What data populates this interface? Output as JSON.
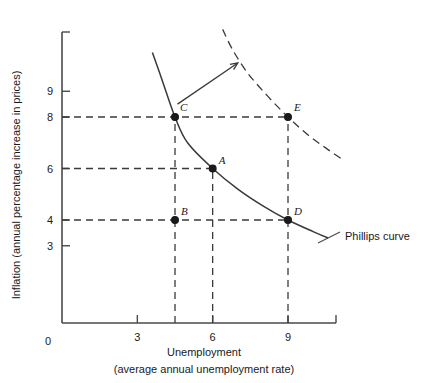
{
  "chart_data": {
    "type": "scatter",
    "title": "",
    "xlabel": "Unemployment",
    "xlabel_sub": "(average annual unemployment rate)",
    "ylabel": "Inflation (annual percentage increase in prices)",
    "xlim": [
      0,
      10.8
    ],
    "ylim": [
      0,
      11.5
    ],
    "xticks": [
      3,
      6,
      9
    ],
    "yticks": [
      3,
      4,
      6,
      8,
      9
    ],
    "origin_label": "0",
    "grid": false,
    "legend": "none",
    "points": [
      {
        "label": "A",
        "x": 6,
        "y": 6,
        "filled": true,
        "label_dx": 6,
        "label_dy": -5
      },
      {
        "label": "B",
        "x": 4.5,
        "y": 4,
        "filled": true,
        "label_dx": 6,
        "label_dy": -5
      },
      {
        "label": "C",
        "x": 4.5,
        "y": 8,
        "filled": true,
        "label_dx": 5,
        "label_dy": -6
      },
      {
        "label": "D",
        "x": 9,
        "y": 4,
        "filled": true,
        "label_dx": 6,
        "label_dy": -5
      },
      {
        "label": "E",
        "x": 9,
        "y": 8,
        "filled": true,
        "label_dx": 6,
        "label_dy": -6
      }
    ],
    "guide_lines": [
      {
        "type": "horizontal",
        "value": 8,
        "from_x": 0,
        "to_x": 9
      },
      {
        "type": "horizontal",
        "value": 6,
        "from_x": 0,
        "to_x": 6
      },
      {
        "type": "horizontal",
        "value": 4,
        "from_x": 0,
        "to_x": 9
      },
      {
        "type": "vertical",
        "value": 4.5,
        "from_y": 0,
        "to_y": 8
      },
      {
        "type": "vertical",
        "value": 6,
        "from_y": 0,
        "to_y": 6
      },
      {
        "type": "vertical",
        "value": 9,
        "from_y": 0,
        "to_y": 8
      }
    ],
    "series": [
      {
        "name": "Phillips curve",
        "style": "solid",
        "label": "Phillips curve",
        "x": [
          3.6,
          4.0,
          4.5,
          5.0,
          6.0,
          7.0,
          8.0,
          9.0,
          10.0,
          10.6
        ],
        "y": [
          10.5,
          9.4,
          8.0,
          7.0,
          6.0,
          5.2,
          4.55,
          4.0,
          3.55,
          3.3
        ]
      },
      {
        "name": "Shifted Phillips curve",
        "style": "dashed",
        "label": "",
        "x": [
          6.4,
          6.8,
          7.4,
          8.2,
          9.0,
          9.8,
          10.5,
          11.1
        ],
        "y": [
          11.4,
          10.6,
          9.7,
          8.8,
          8.0,
          7.3,
          6.8,
          6.4
        ]
      }
    ],
    "annotations": [
      {
        "type": "arrow",
        "from_x": 4.6,
        "from_y": 8.5,
        "to_x": 7.0,
        "to_y": 10.1
      }
    ]
  }
}
